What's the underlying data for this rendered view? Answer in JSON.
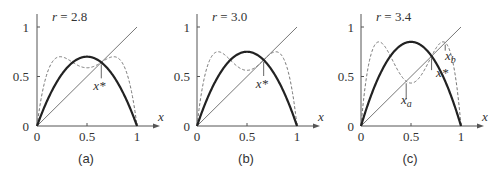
{
  "chart_data": [
    {
      "type": "line",
      "panel_label": "(a)",
      "title": "r = 2.8",
      "r": 2.8,
      "xlabel": "x",
      "ylabel": "",
      "xlim": [
        0,
        1.1
      ],
      "ylim": [
        0,
        1.1
      ],
      "xticks": [
        "0",
        "0.5",
        "1"
      ],
      "yticks": [
        "0",
        "0.5",
        "1"
      ],
      "grid": false,
      "series": [
        {
          "name": "f(x) = r x (1 - x)",
          "style": "solid-thick",
          "x": [
            0,
            0.1,
            0.2,
            0.3,
            0.4,
            0.5,
            0.6,
            0.7,
            0.8,
            0.9,
            1.0
          ],
          "values": [
            0,
            0.252,
            0.448,
            0.588,
            0.672,
            0.7,
            0.672,
            0.588,
            0.448,
            0.252,
            0
          ]
        },
        {
          "name": "f(f(x))",
          "style": "dashed",
          "x": [
            0,
            0.1,
            0.2,
            0.3,
            0.4,
            0.5,
            0.6,
            0.7,
            0.8,
            0.9,
            1.0
          ],
          "values": [
            0,
            0.528,
            0.692,
            0.678,
            0.617,
            0.588,
            0.617,
            0.678,
            0.692,
            0.528,
            0
          ]
        },
        {
          "name": "y = x",
          "style": "thin",
          "x": [
            0,
            1
          ],
          "values": [
            0,
            1
          ]
        }
      ],
      "annotations": [
        {
          "text": "x*",
          "x": 0.643,
          "y": 0.643
        }
      ]
    },
    {
      "type": "line",
      "panel_label": "(b)",
      "title": "r = 3.0",
      "r": 3.0,
      "xlabel": "x",
      "ylabel": "",
      "xlim": [
        0,
        1.1
      ],
      "ylim": [
        0,
        1.1
      ],
      "xticks": [
        "0",
        "0.5",
        "1"
      ],
      "yticks": [
        "0",
        "0.5",
        "1"
      ],
      "grid": false,
      "series": [
        {
          "name": "f(x) = r x (1 - x)",
          "style": "solid-thick",
          "x": [
            0,
            0.1,
            0.2,
            0.3,
            0.4,
            0.5,
            0.6,
            0.7,
            0.8,
            0.9,
            1.0
          ],
          "values": [
            0,
            0.27,
            0.48,
            0.63,
            0.72,
            0.75,
            0.72,
            0.63,
            0.48,
            0.27,
            0
          ]
        },
        {
          "name": "f(f(x))",
          "style": "dashed",
          "x": [
            0,
            0.1,
            0.2,
            0.3,
            0.4,
            0.5,
            0.6,
            0.7,
            0.8,
            0.9,
            1.0
          ],
          "values": [
            0,
            0.591,
            0.749,
            0.699,
            0.605,
            0.563,
            0.605,
            0.699,
            0.749,
            0.591,
            0
          ]
        },
        {
          "name": "y = x",
          "style": "thin",
          "x": [
            0,
            1
          ],
          "values": [
            0,
            1
          ]
        }
      ],
      "annotations": [
        {
          "text": "x*",
          "x": 0.667,
          "y": 0.667
        }
      ]
    },
    {
      "type": "line",
      "panel_label": "(c)",
      "title": "r = 3.4",
      "r": 3.4,
      "xlabel": "x",
      "ylabel": "",
      "xlim": [
        0,
        1.1
      ],
      "ylim": [
        0,
        1.1
      ],
      "xticks": [
        "0",
        "0.5",
        "1"
      ],
      "yticks": [
        "0",
        "0.5",
        "1"
      ],
      "grid": false,
      "series": [
        {
          "name": "f(x) = r x (1 - x)",
          "style": "solid-thick",
          "x": [
            0,
            0.1,
            0.2,
            0.3,
            0.4,
            0.5,
            0.6,
            0.7,
            0.8,
            0.9,
            1.0
          ],
          "values": [
            0,
            0.306,
            0.544,
            0.714,
            0.816,
            0.85,
            0.816,
            0.714,
            0.544,
            0.306,
            0
          ]
        },
        {
          "name": "f(f(x))",
          "style": "dashed",
          "x": [
            0,
            0.1,
            0.2,
            0.3,
            0.4,
            0.5,
            0.6,
            0.7,
            0.8,
            0.9,
            1.0
          ],
          "values": [
            0,
            0.722,
            0.843,
            0.694,
            0.511,
            0.434,
            0.511,
            0.694,
            0.843,
            0.722,
            0
          ]
        },
        {
          "name": "y = x",
          "style": "thin",
          "x": [
            0,
            1
          ],
          "values": [
            0,
            1
          ]
        }
      ],
      "annotations": [
        {
          "text": "x_a",
          "x": 0.452,
          "y": 0.452
        },
        {
          "text": "x*",
          "x": 0.706,
          "y": 0.706
        },
        {
          "text": "x_b",
          "x": 0.842,
          "y": 0.842
        }
      ]
    }
  ],
  "panels": [
    {
      "label": "(a)",
      "title_var": "r",
      "title_eq": " = 2.8",
      "xaxis_label": "x",
      "ticks": {
        "x0": "0",
        "x05": "0.5",
        "x1": "1",
        "y0": "0",
        "y05": "0.5",
        "y1": "1"
      },
      "annotation_xstar": "x*"
    },
    {
      "label": "(b)",
      "title_var": "r",
      "title_eq": " = 3.0",
      "xaxis_label": "x",
      "ticks": {
        "x0": "0",
        "x05": "0.5",
        "x1": "1",
        "y0": "0",
        "y05": "0.5",
        "y1": "1"
      },
      "annotation_xstar": "x*"
    },
    {
      "label": "(c)",
      "title_var": "r",
      "title_eq": " = 3.4",
      "xaxis_label": "x",
      "ticks": {
        "x0": "0",
        "x05": "0.5",
        "x1": "1",
        "y0": "0",
        "y05": "0.5",
        "y1": "1"
      },
      "annotation_xstar": "x*",
      "annotation_xa": "x",
      "annotation_xa_sub": "a",
      "annotation_xb": "x",
      "annotation_xb_sub": "b"
    }
  ]
}
